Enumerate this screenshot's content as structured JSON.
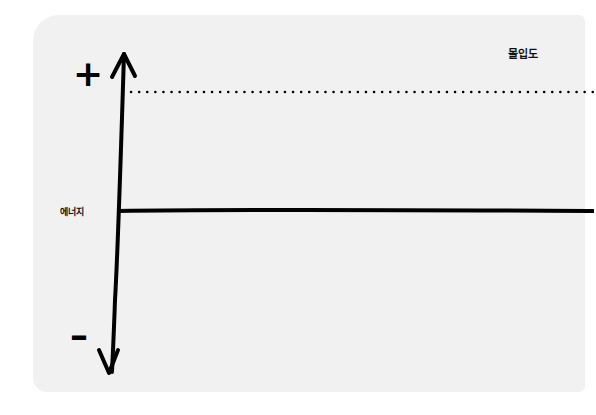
{
  "diagram": {
    "y_axis": {
      "positive_sign": "+",
      "negative_sign": "–",
      "label": "에너지"
    },
    "top_dotted_line_label": "몰입도",
    "colors": {
      "card_background": "#f1f1f1",
      "line": "#000000"
    }
  }
}
